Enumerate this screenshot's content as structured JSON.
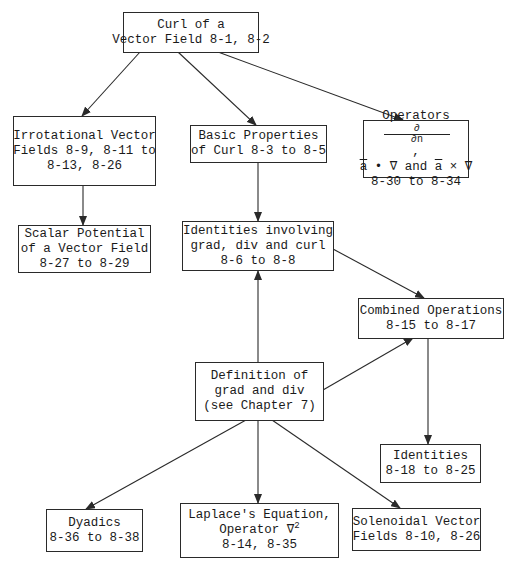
{
  "diagram": {
    "type": "flowchart",
    "nodes": [
      {
        "id": "curl",
        "lines": [
          "Curl of a",
          "Vector Field 8-1, 8-2"
        ]
      },
      {
        "id": "irrotational",
        "lines": [
          "Irrotational Vector",
          "Fields 8-9, 8-11 to",
          "8-13, 8-26"
        ]
      },
      {
        "id": "basic",
        "lines": [
          "Basic Properties",
          "of Curl 8-3 to 8-5"
        ]
      },
      {
        "id": "operators",
        "lines": [
          "Operators",
          "a",
          "∇ and",
          "a",
          "× ∇",
          "8-30 to 8-34"
        ],
        "fraction": {
          "num": "∂",
          "den": "∂n"
        },
        "dot": "•"
      },
      {
        "id": "scalar",
        "lines": [
          "Scalar Potential",
          "of a Vector Field",
          "8-27 to 8-29"
        ]
      },
      {
        "id": "identities_gdc",
        "lines": [
          "Identities involving",
          "grad, div and curl",
          "8-6 to 8-8"
        ]
      },
      {
        "id": "combined",
        "lines": [
          "Combined Operations",
          "8-15 to 8-17"
        ]
      },
      {
        "id": "definition",
        "lines": [
          "Definition of",
          "grad and div",
          "(see Chapter 7)"
        ]
      },
      {
        "id": "identities",
        "lines": [
          "Identities",
          "8-18 to 8-25"
        ]
      },
      {
        "id": "dyadics",
        "lines": [
          "Dyadics",
          "8-36 to 8-38"
        ]
      },
      {
        "id": "laplace",
        "lines": [
          "Laplace's Equation,",
          "Operator ∇",
          "2",
          "8-14, 8-35"
        ]
      },
      {
        "id": "solenoidal",
        "lines": [
          "Solenoidal Vector",
          "Fields 8-10, 8-26"
        ]
      }
    ],
    "edges": [
      {
        "from": "curl",
        "to": "irrotational"
      },
      {
        "from": "curl",
        "to": "basic"
      },
      {
        "from": "curl",
        "to": "operators"
      },
      {
        "from": "irrotational",
        "to": "scalar"
      },
      {
        "from": "basic",
        "to": "identities_gdc"
      },
      {
        "from": "identities_gdc",
        "to": "combined"
      },
      {
        "from": "definition",
        "to": "identities_gdc"
      },
      {
        "from": "definition",
        "to": "combined"
      },
      {
        "from": "combined",
        "to": "identities"
      },
      {
        "from": "definition",
        "to": "dyadics"
      },
      {
        "from": "definition",
        "to": "laplace"
      },
      {
        "from": "definition",
        "to": "solenoidal"
      }
    ],
    "colors": {
      "line": "#2a2a2a",
      "background": "#ffffff",
      "text": "#1a1a1a"
    }
  }
}
